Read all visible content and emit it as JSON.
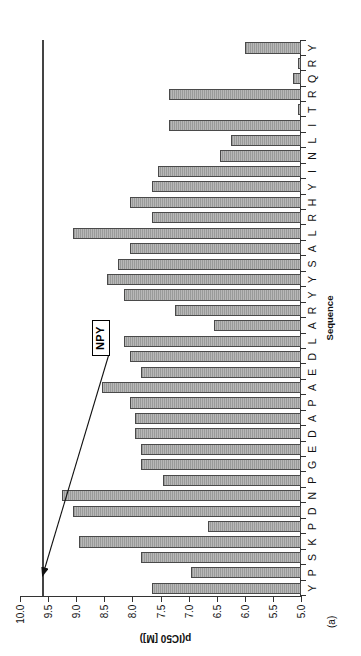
{
  "figure": {
    "panel_label": "(a)",
    "annotation_label": "NPY",
    "reference_line_value": 9.6
  },
  "chart_data": {
    "type": "bar",
    "title": "",
    "subtitle": "",
    "xlabel": "Sequence",
    "ylabel": "p(IC50 [M])",
    "ylim": [
      5.0,
      10.0
    ],
    "grid": false,
    "legend": "none",
    "orientation": "vertical-bars-rotated-90ccw",
    "y_ticks": [
      "10.0",
      "9.5",
      "9.0",
      "8.5",
      "8.0",
      "7.5",
      "7.0",
      "6.5",
      "6.0",
      "5.5",
      "5.0"
    ],
    "y_tick_values": [
      10.0,
      9.5,
      9.0,
      8.5,
      8.0,
      7.5,
      7.0,
      6.5,
      6.0,
      5.5,
      5.0
    ],
    "baseline": 5.0,
    "categories": [
      "Y",
      "P",
      "S",
      "K",
      "P",
      "D",
      "N",
      "P",
      "G",
      "E",
      "D",
      "A",
      "P",
      "A",
      "E",
      "D",
      "L",
      "A",
      "R",
      "Y",
      "Y",
      "S",
      "A",
      "L",
      "R",
      "H",
      "Y",
      "I",
      "N",
      "L",
      "I",
      "T",
      "R",
      "Q",
      "R",
      "Y"
    ],
    "values": [
      7.65,
      6.95,
      7.85,
      8.95,
      6.65,
      9.05,
      9.25,
      7.45,
      7.85,
      7.85,
      7.95,
      7.95,
      8.05,
      8.55,
      7.85,
      8.05,
      8.15,
      6.55,
      7.25,
      8.15,
      8.45,
      8.25,
      8.05,
      9.05,
      7.65,
      8.05,
      7.65,
      7.55,
      6.45,
      6.25,
      7.35,
      5.05,
      7.35,
      5.15,
      5.05,
      6.0
    ],
    "annotations": [
      {
        "text": "NPY",
        "kind": "reference-line-callout",
        "value": 9.6,
        "description": "horizontal reference line marking native NPY potency"
      }
    ]
  }
}
